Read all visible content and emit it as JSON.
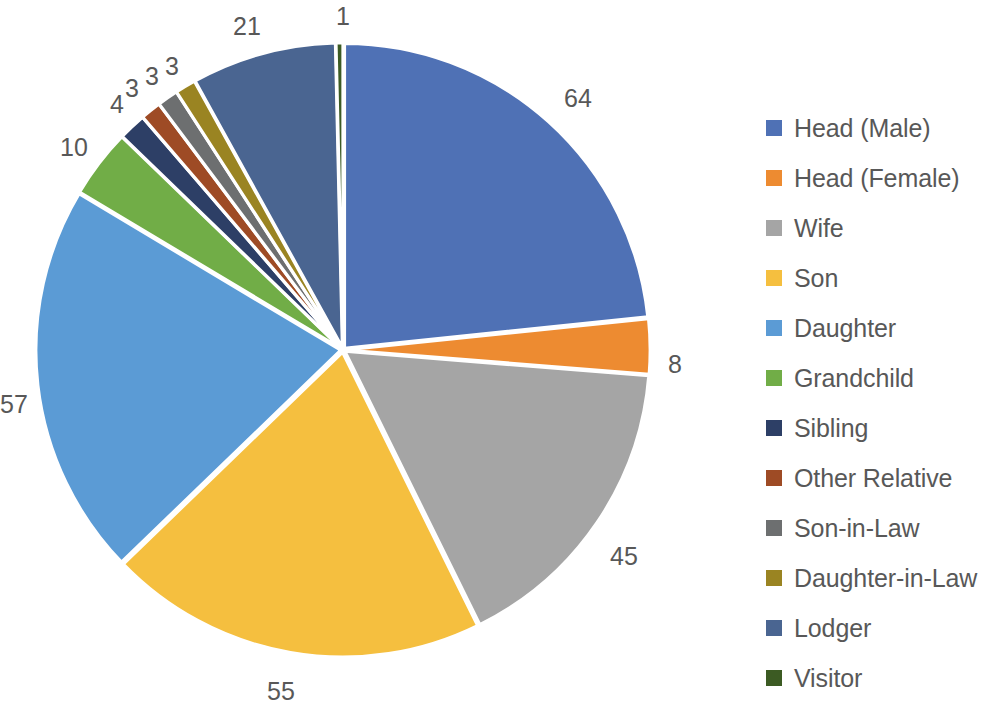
{
  "chart_data": {
    "type": "pie",
    "title": "",
    "categories": [
      "Head (Male)",
      "Head (Female)",
      "Wife",
      "Son",
      "Daughter",
      "Grandchild",
      "Sibling",
      "Other Relative",
      "Son-in-Law",
      "Daughter-in-Law",
      "Lodger",
      "Visitor"
    ],
    "values": [
      64,
      8,
      45,
      55,
      57,
      10,
      4,
      3,
      3,
      3,
      21,
      1
    ],
    "total": 274,
    "colors": [
      "#4f71b5",
      "#ed8b31",
      "#a5a5a5",
      "#f5bf3f",
      "#5b9bd5",
      "#71ad47",
      "#2d3f66",
      "#9e4b25",
      "#6d6f70",
      "#9a8422",
      "#4a6591",
      "#3c5b23"
    ],
    "start_angle_deg": 0,
    "direction": "clockwise",
    "slice_gap": true,
    "data_labels_outside": true,
    "legend_position": "right",
    "grid": false,
    "xlabel": "",
    "ylabel": ""
  },
  "legend": {
    "items": [
      {
        "label": "Head (Male)",
        "color": "#4f71b5"
      },
      {
        "label": "Head (Female)",
        "color": "#ed8b31"
      },
      {
        "label": "Wife",
        "color": "#a5a5a5"
      },
      {
        "label": "Son",
        "color": "#f5bf3f"
      },
      {
        "label": "Daughter",
        "color": "#5b9bd5"
      },
      {
        "label": "Grandchild",
        "color": "#71ad47"
      },
      {
        "label": "Sibling",
        "color": "#2d3f66"
      },
      {
        "label": "Other Relative",
        "color": "#9e4b25"
      },
      {
        "label": "Son-in-Law",
        "color": "#6d6f70"
      },
      {
        "label": "Daughter-in-Law",
        "color": "#9a8422"
      },
      {
        "label": "Lodger",
        "color": "#4a6591"
      },
      {
        "label": "Visitor",
        "color": "#3c5b23"
      }
    ]
  },
  "data_labels": [
    {
      "text": "64",
      "x": 578,
      "y": 98,
      "for": "Head (Male)"
    },
    {
      "text": "8",
      "x": 675,
      "y": 364,
      "for": "Head (Female)"
    },
    {
      "text": "45",
      "x": 624,
      "y": 556,
      "for": "Wife"
    },
    {
      "text": "55",
      "x": 281,
      "y": 691,
      "for": "Son"
    },
    {
      "text": "57",
      "x": 14,
      "y": 404,
      "for": "Daughter"
    },
    {
      "text": "10",
      "x": 74,
      "y": 147,
      "for": "Grandchild"
    },
    {
      "text": "4",
      "x": 117,
      "y": 104,
      "for": "Sibling"
    },
    {
      "text": "3",
      "x": 132,
      "y": 88,
      "for": "Other Relative"
    },
    {
      "text": "3",
      "x": 152,
      "y": 76,
      "for": "Son-in-Law"
    },
    {
      "text": "3",
      "x": 172,
      "y": 66,
      "for": "Daughter-in-Law"
    },
    {
      "text": "21",
      "x": 247,
      "y": 26,
      "for": "Lodger"
    },
    {
      "text": "1",
      "x": 343,
      "y": 16,
      "for": "Visitor"
    }
  ],
  "geometry": {
    "center_x": 343,
    "center_y": 350,
    "radius": 305
  }
}
